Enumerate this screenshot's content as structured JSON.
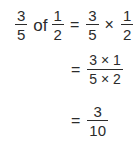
{
  "expression": {
    "line1": {
      "lhs_fraction": {
        "numerator": "3",
        "denominator": "5"
      },
      "word": "of",
      "lhs_fraction2": {
        "numerator": "1",
        "denominator": "2"
      },
      "equals": "=",
      "rhs_fraction": {
        "numerator": "3",
        "denominator": "5"
      },
      "times": "×",
      "rhs_fraction2": {
        "numerator": "1",
        "denominator": "2"
      }
    },
    "line2": {
      "equals": "=",
      "fraction": {
        "numerator": "3 × 1",
        "denominator": "5 × 2"
      }
    },
    "line3": {
      "equals": "=",
      "fraction": {
        "numerator": "3",
        "denominator": "10"
      }
    }
  },
  "colors": {
    "text": "#2b2b2b",
    "background": "#ffffff"
  }
}
